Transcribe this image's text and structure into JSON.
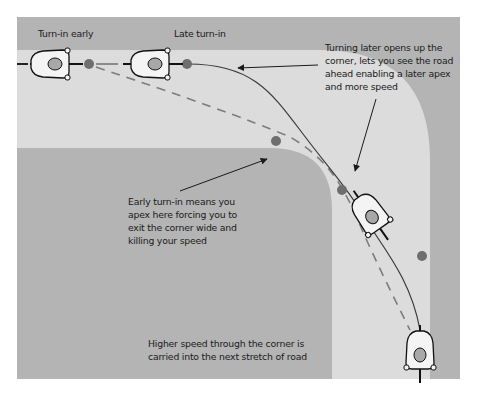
{
  "colors": {
    "background": "#b4b4b4",
    "road": "#dcdcdc",
    "dashed_line": "#7c7c7c",
    "solid_line": "#3a3a3a",
    "apex_dot": "#6e6e6e",
    "rider_body": "#f4f4f4",
    "rider_helmet": "#a8a8a8"
  },
  "labels": {
    "turn_in_early": "Turn-in early",
    "late_turn_in": "Late turn-in"
  },
  "annotations": {
    "late_turn_in": [
      "Turning later opens up the",
      "corner, lets you see the road",
      "ahead enabling a later apex",
      "and more speed"
    ],
    "early_turn_in": [
      "Early turn-in means you",
      "apex here forcing you to",
      "exit the corner wide and",
      "killing your speed"
    ],
    "higher_speed": [
      "Higher speed through the corner is",
      "carried into the next stretch of road"
    ]
  },
  "lines": [
    {
      "name": "early-turn-in-line",
      "style": "dashed"
    },
    {
      "name": "late-turn-in-line",
      "style": "solid"
    }
  ]
}
